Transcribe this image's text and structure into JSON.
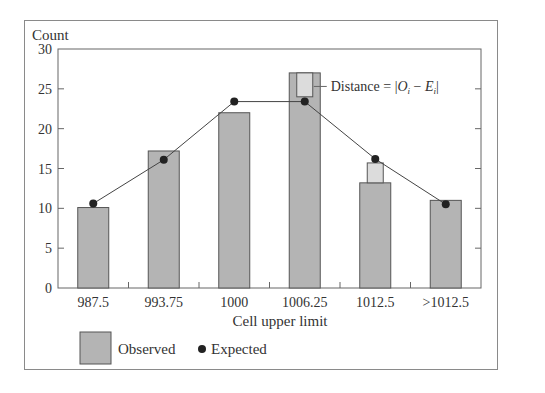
{
  "chart_data": {
    "type": "bar",
    "title": "",
    "xlabel": "Cell upper limit",
    "ylabel": "Count",
    "ylim": [
      0,
      30
    ],
    "yticks": [
      0,
      5,
      10,
      15,
      20,
      25,
      30
    ],
    "grid": false,
    "categories": [
      "987.5",
      "993.75",
      "1000",
      "1006.25",
      "1012.5",
      ">1012.5"
    ],
    "series": [
      {
        "name": "Observed",
        "type": "bar",
        "values": [
          10.1,
          17.2,
          22,
          27,
          13.2,
          11
        ]
      },
      {
        "name": "Expected",
        "type": "line-markers",
        "values": [
          10.6,
          16.1,
          23.4,
          23.4,
          16.2,
          10.5
        ]
      }
    ],
    "annotations": [
      {
        "text": "Distance = |Oᵢ − Eᵢ|",
        "category": "1006.25",
        "from": 24,
        "to": 27
      }
    ],
    "legend": {
      "position": "bottom-left",
      "entries": [
        "Observed",
        "Expected"
      ]
    }
  },
  "labels": {
    "y_axis_title": "Count",
    "x_axis_title": "Cell upper limit",
    "annotation_prefix": "Distance = |",
    "annotation_O": "O",
    "annotation_i1": "i",
    "annotation_minus": " − ",
    "annotation_E": "E",
    "annotation_i2": "i",
    "annotation_suffix": "|",
    "legend_observed": "Observed",
    "legend_expected": "Expected"
  },
  "colors": {
    "bar_fill": "#b4b4b4",
    "bar_stroke": "#555555",
    "distance_fill": "#dcdcdc",
    "marker": "#222222",
    "line": "#444444",
    "axis": "#666666"
  }
}
